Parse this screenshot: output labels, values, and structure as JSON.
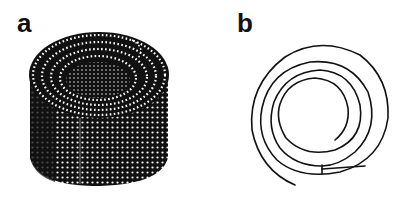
{
  "figure": {
    "panels": [
      {
        "label": "a",
        "description": "rolled sheet of dots (scroll structure), 3D view"
      },
      {
        "label": "b",
        "description": "spiral cross-section of the scroll"
      }
    ],
    "colors": {
      "ink": "#111111",
      "dot": "#ffffff",
      "background": "#ffffff"
    }
  }
}
